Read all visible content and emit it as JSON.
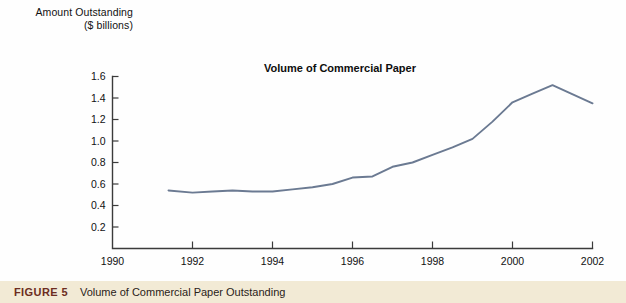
{
  "figure": {
    "caption_label": "FIGURE 5",
    "caption_title": "Volume of Commercial Paper Outstanding",
    "caption_bg": "#f2ead5",
    "caption_label_color": "#6d2d21"
  },
  "axis_label": {
    "line1": "Amount Outstanding",
    "line2": "($ billions)"
  },
  "chart_data": {
    "type": "line",
    "title": "Volume of Commercial Paper",
    "xlabel": "",
    "ylabel": "Amount Outstanding ($ billions)",
    "xlim": [
      1990,
      2002
    ],
    "ylim": [
      0,
      1.6
    ],
    "grid": false,
    "legend": "none",
    "line_color": "#6b7a92",
    "axis_color": "#3b3b3b",
    "x_ticks": [
      1990,
      1992,
      1994,
      1996,
      1998,
      2000,
      2002
    ],
    "x_tick_labels": [
      "1990",
      "1992",
      "1994",
      "1996",
      "1998",
      "2000",
      "2002"
    ],
    "y_ticks": [
      0.2,
      0.4,
      0.6,
      0.8,
      1.0,
      1.2,
      1.4,
      1.6
    ],
    "y_tick_labels": [
      "0.2",
      "0.4",
      "0.6",
      "0.8",
      "1.0",
      "1.2",
      "1.4",
      "1.6"
    ],
    "series": [
      {
        "name": "Volume of Commercial Paper",
        "x": [
          1991.4,
          1992.0,
          1992.5,
          1993.0,
          1993.5,
          1994.0,
          1994.5,
          1995.0,
          1995.5,
          1996.0,
          1996.5,
          1997.0,
          1997.5,
          1998.0,
          1998.5,
          1999.0,
          1999.5,
          2000.0,
          2000.5,
          2001.0,
          2002.0
        ],
        "values": [
          0.54,
          0.52,
          0.53,
          0.54,
          0.53,
          0.53,
          0.55,
          0.57,
          0.6,
          0.66,
          0.67,
          0.76,
          0.8,
          0.87,
          0.94,
          1.02,
          1.18,
          1.36,
          1.44,
          1.52,
          1.35
        ]
      }
    ]
  }
}
